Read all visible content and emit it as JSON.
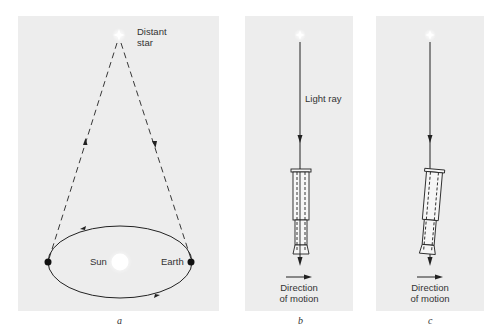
{
  "figure": {
    "panels": [
      {
        "id": "a",
        "caption": "a",
        "labels": {
          "star_line1": "Distant",
          "star_line2": "star",
          "sun": "Sun",
          "earth": "Earth"
        }
      },
      {
        "id": "b",
        "caption": "b",
        "labels": {
          "ray": "Light ray",
          "motion_line1": "Direction",
          "motion_line2": "of motion"
        }
      },
      {
        "id": "c",
        "caption": "c",
        "labels": {
          "motion_line1": "Direction",
          "motion_line2": "of motion"
        }
      }
    ],
    "colors": {
      "panel_bg": "#ededed",
      "line": "#222222",
      "star": "#ffffff",
      "sun": "#ffffff"
    }
  }
}
